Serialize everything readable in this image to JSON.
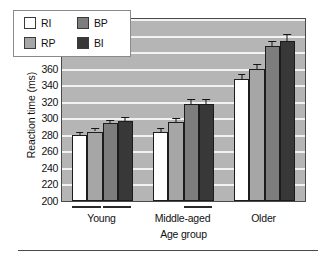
{
  "chart_data": {
    "type": "bar",
    "title": "",
    "xlabel": "Age group",
    "ylabel": "Reaction time (ms)",
    "ylim": [
      200,
      420
    ],
    "ytick_step": 20,
    "yticks": [
      420,
      400,
      380,
      360,
      340,
      320,
      300,
      280,
      260,
      240,
      220,
      200
    ],
    "categories": [
      "Young",
      "Middle-aged",
      "Older"
    ],
    "grid": "horizontal",
    "legend_position": "top-left-inside",
    "series": [
      {
        "name": "RI",
        "color": "#ffffff",
        "values": [
          280,
          283,
          347
        ],
        "errors": [
          4,
          5,
          6
        ]
      },
      {
        "name": "RP",
        "color": "#a6a6a6",
        "values": [
          284,
          295,
          360
        ],
        "errors": [
          4,
          5,
          6
        ]
      },
      {
        "name": "BP",
        "color": "#7d7d7d",
        "values": [
          294,
          317,
          387
        ],
        "errors": [
          4,
          6,
          7
        ]
      },
      {
        "name": "BI",
        "color": "#383838",
        "values": [
          297,
          317,
          394
        ],
        "errors": [
          4,
          6,
          8
        ]
      }
    ],
    "significance_brackets": [
      {
        "group": "Young",
        "from": "RI",
        "to": "RP"
      },
      {
        "group": "Young",
        "from": "BP",
        "to": "BI"
      },
      {
        "group": "Middle-aged",
        "from": "BP",
        "to": "BI"
      }
    ]
  },
  "legend": {
    "items": [
      {
        "label": "RI",
        "color": "#ffffff"
      },
      {
        "label": "RP",
        "color": "#a6a6a6"
      },
      {
        "label": "BP",
        "color": "#7d7d7d"
      },
      {
        "label": "BI",
        "color": "#383838"
      }
    ]
  },
  "axes": {
    "y_title": "Reaction time (ms)",
    "x_title": "Age group"
  }
}
